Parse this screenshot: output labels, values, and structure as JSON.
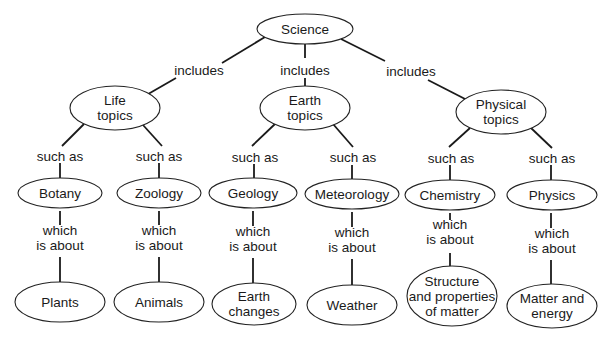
{
  "colors": {
    "line": "#1a1a1a",
    "node_fill": "#ffffff",
    "node_stroke": "#222222",
    "text": "#1a1a1a",
    "background": "#ffffff"
  },
  "nodes": [
    {
      "id": "science",
      "lines": [
        "Science"
      ],
      "cx": 305,
      "cy": 29,
      "rx": 48,
      "ry": 15
    },
    {
      "id": "life",
      "lines": [
        "Life",
        "topics"
      ],
      "cx": 115,
      "cy": 108,
      "rx": 45,
      "ry": 22
    },
    {
      "id": "earth",
      "lines": [
        "Earth",
        "topics"
      ],
      "cx": 305,
      "cy": 108,
      "rx": 45,
      "ry": 22
    },
    {
      "id": "physical",
      "lines": [
        "Physical",
        "topics"
      ],
      "cx": 501,
      "cy": 112,
      "rx": 45,
      "ry": 22
    },
    {
      "id": "botany",
      "lines": [
        "Botany"
      ],
      "cx": 60,
      "cy": 193,
      "rx": 42,
      "ry": 15
    },
    {
      "id": "zoology",
      "lines": [
        "Zoology"
      ],
      "cx": 159,
      "cy": 193,
      "rx": 42,
      "ry": 15
    },
    {
      "id": "geology",
      "lines": [
        "Geology"
      ],
      "cx": 253,
      "cy": 193,
      "rx": 44,
      "ry": 15
    },
    {
      "id": "meteorology",
      "lines": [
        "Meteorology"
      ],
      "cx": 352,
      "cy": 194,
      "rx": 47,
      "ry": 15
    },
    {
      "id": "chemistry",
      "lines": [
        "Chemistry"
      ],
      "cx": 450,
      "cy": 195,
      "rx": 45,
      "ry": 15
    },
    {
      "id": "physics",
      "lines": [
        "Physics"
      ],
      "cx": 552,
      "cy": 195,
      "rx": 45,
      "ry": 15
    },
    {
      "id": "plants",
      "lines": [
        "Plants"
      ],
      "cx": 60,
      "cy": 302,
      "rx": 45,
      "ry": 20
    },
    {
      "id": "animals",
      "lines": [
        "Animals"
      ],
      "cx": 159,
      "cy": 302,
      "rx": 45,
      "ry": 20
    },
    {
      "id": "earth_changes",
      "lines": [
        "Earth",
        "changes"
      ],
      "cx": 254,
      "cy": 304,
      "rx": 42,
      "ry": 21
    },
    {
      "id": "weather",
      "lines": [
        "Weather"
      ],
      "cx": 352,
      "cy": 305,
      "rx": 45,
      "ry": 20
    },
    {
      "id": "structure",
      "lines": [
        "Structure",
        "and properties",
        "of matter"
      ],
      "cx": 452,
      "cy": 296,
      "rx": 45,
      "ry": 30
    },
    {
      "id": "matter_energy",
      "lines": [
        "Matter and",
        "energy"
      ],
      "cx": 552,
      "cy": 306,
      "rx": 45,
      "ry": 22
    }
  ],
  "links": [
    {
      "id": "science-life",
      "lines": [
        "includes"
      ],
      "x": 199,
      "y": 70
    },
    {
      "id": "science-earth",
      "lines": [
        "includes"
      ],
      "x": 305,
      "y": 70
    },
    {
      "id": "science-physical",
      "lines": [
        "includes"
      ],
      "x": 411,
      "y": 71
    },
    {
      "id": "life-botany",
      "lines": [
        "such as"
      ],
      "x": 60,
      "y": 156
    },
    {
      "id": "life-zoology",
      "lines": [
        "such as"
      ],
      "x": 159,
      "y": 156
    },
    {
      "id": "earth-geology",
      "lines": [
        "such as"
      ],
      "x": 255,
      "y": 157
    },
    {
      "id": "earth-meteorology",
      "lines": [
        "such as"
      ],
      "x": 353,
      "y": 157
    },
    {
      "id": "physical-chemistry",
      "lines": [
        "such as"
      ],
      "x": 451,
      "y": 158
    },
    {
      "id": "physical-physics",
      "lines": [
        "such as"
      ],
      "x": 552,
      "y": 158
    },
    {
      "id": "botany-plants",
      "lines": [
        "which",
        "is about"
      ],
      "x": 60,
      "y": 238
    },
    {
      "id": "zoology-animals",
      "lines": [
        "which",
        "is about"
      ],
      "x": 159,
      "y": 238
    },
    {
      "id": "geology-earth_changes",
      "lines": [
        "which",
        "is about"
      ],
      "x": 253,
      "y": 239
    },
    {
      "id": "meteorology-weather",
      "lines": [
        "which",
        "is about"
      ],
      "x": 352,
      "y": 240
    },
    {
      "id": "chemistry-structure",
      "lines": [
        "which",
        "is about"
      ],
      "x": 450,
      "y": 232
    },
    {
      "id": "physics-matter_energy",
      "lines": [
        "which",
        "is about"
      ],
      "x": 552,
      "y": 241
    }
  ],
  "edges": [
    [
      265,
      37,
      222,
      63
    ],
    [
      176,
      78,
      143,
      97
    ],
    [
      305,
      44,
      305,
      58
    ],
    [
      305,
      78,
      305,
      86
    ],
    [
      341,
      39,
      385,
      61
    ],
    [
      428,
      80,
      469,
      101
    ],
    [
      84,
      124,
      62,
      146
    ],
    [
      143,
      125,
      162,
      146
    ],
    [
      275,
      124,
      252,
      146
    ],
    [
      333,
      124,
      353,
      147
    ],
    [
      470,
      128,
      449,
      147
    ],
    [
      531,
      128,
      552,
      148
    ],
    [
      60,
      163,
      60,
      178
    ],
    [
      159,
      163,
      159,
      178
    ],
    [
      254,
      164,
      254,
      178
    ],
    [
      352,
      165,
      352,
      179
    ],
    [
      450,
      165,
      450,
      180
    ],
    [
      551,
      165,
      551,
      180
    ],
    [
      60,
      211,
      60,
      225
    ],
    [
      60,
      257,
      60,
      282
    ],
    [
      159,
      211,
      159,
      225
    ],
    [
      159,
      257,
      159,
      282
    ],
    [
      253,
      211,
      253,
      226
    ],
    [
      253,
      258,
      253,
      283
    ],
    [
      352,
      212,
      352,
      227
    ],
    [
      352,
      259,
      352,
      285
    ],
    [
      450,
      213,
      450,
      220
    ],
    [
      450,
      253,
      450,
      266
    ],
    [
      551,
      213,
      551,
      228
    ],
    [
      551,
      260,
      551,
      284
    ]
  ]
}
